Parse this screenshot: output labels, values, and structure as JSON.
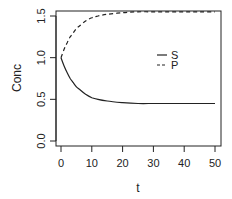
{
  "chart_data": {
    "type": "line",
    "title": "",
    "xlabel": "t",
    "ylabel": "Conc",
    "xlim": [
      0,
      50
    ],
    "ylim": [
      0,
      1.55
    ],
    "xticks": [
      0,
      10,
      20,
      30,
      40,
      50
    ],
    "yticks": [
      0.0,
      0.5,
      1.0,
      1.5
    ],
    "xtick_labels": [
      "0",
      "10",
      "20",
      "30",
      "40",
      "50"
    ],
    "ytick_labels": [
      "0.0",
      "0.5",
      "1.0",
      "1.5"
    ],
    "grid": false,
    "legend": {
      "position": "inside-right",
      "entries": [
        {
          "name": "S",
          "style": "solid"
        },
        {
          "name": "P",
          "style": "dashed"
        }
      ]
    },
    "x": [
      0,
      1,
      2,
      3,
      4,
      5,
      6,
      8,
      10,
      12,
      15,
      20,
      25,
      30,
      35,
      40,
      45,
      50
    ],
    "series": [
      {
        "name": "S",
        "style": "solid",
        "values": [
          1.0,
          0.9,
          0.82,
          0.75,
          0.7,
          0.65,
          0.62,
          0.56,
          0.52,
          0.5,
          0.48,
          0.46,
          0.45,
          0.45,
          0.45,
          0.45,
          0.45,
          0.45
        ]
      },
      {
        "name": "P",
        "style": "dashed",
        "values": [
          1.0,
          1.1,
          1.18,
          1.25,
          1.3,
          1.35,
          1.38,
          1.44,
          1.48,
          1.5,
          1.52,
          1.54,
          1.55,
          1.55,
          1.55,
          1.55,
          1.55,
          1.55
        ]
      }
    ]
  }
}
